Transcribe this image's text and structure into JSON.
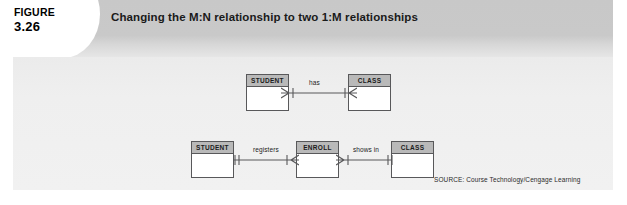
{
  "figure": {
    "label": "FIGURE",
    "number": "3.26",
    "title": "Changing the M:N relationship to two 1:M relationships"
  },
  "source": {
    "text": "SOURCE: Course Technology/Cengage Learning"
  },
  "colors": {
    "banner": "#c9c9c9",
    "panel": "#efefef",
    "entity_header": "#b9b9b9",
    "entity_body": "#ffffff",
    "line": "#58585a",
    "page": "#ffffff"
  },
  "diagram": {
    "top_row": {
      "description": "Original M:N relationship",
      "entities": [
        {
          "name": "STUDENT",
          "x": 246,
          "y": 74,
          "w": 43,
          "h": 37
        },
        {
          "name": "CLASS",
          "x": 348,
          "y": 74,
          "w": 43,
          "h": 37
        }
      ],
      "relationships": [
        {
          "label": "has",
          "from": "STUDENT",
          "to": "CLASS",
          "from_cardinality": "crows-foot-mandatory-many",
          "to_cardinality": "crows-foot-mandatory-many",
          "cardinality_text": "M:N"
        }
      ]
    },
    "bottom_row": {
      "description": "Decomposed into two 1:M relationships via bridge entity",
      "entities": [
        {
          "name": "STUDENT",
          "x": 191,
          "y": 141,
          "w": 43,
          "h": 37
        },
        {
          "name": "ENROLL",
          "x": 296,
          "y": 141,
          "w": 43,
          "h": 37
        },
        {
          "name": "CLASS",
          "x": 391,
          "y": 141,
          "w": 43,
          "h": 37
        }
      ],
      "relationships": [
        {
          "label": "registers",
          "from": "STUDENT",
          "to": "ENROLL",
          "from_cardinality": "mandatory-one",
          "to_cardinality": "crows-foot-mandatory-many",
          "cardinality_text": "1:M"
        },
        {
          "label": "shows in",
          "from": "ENROLL",
          "to": "CLASS",
          "from_cardinality": "crows-foot-mandatory-many",
          "to_cardinality": "mandatory-one",
          "cardinality_text": "M:1"
        }
      ]
    }
  }
}
